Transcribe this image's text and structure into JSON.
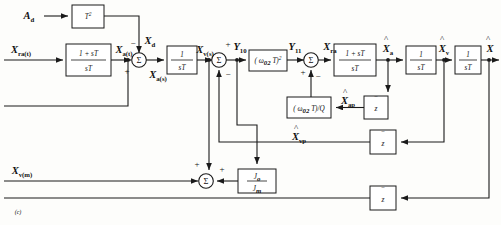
{
  "figure": {
    "caption": "(c)",
    "type": "control-system-block-diagram"
  },
  "inputs": [
    {
      "id": "a_d",
      "label": "A",
      "sub": "d"
    },
    {
      "id": "x_ra_t",
      "label": "X",
      "sub": "ra(t)"
    },
    {
      "id": "x_v_m",
      "label": "X",
      "sub": "v(m)"
    }
  ],
  "blocks": [
    {
      "id": "t-squared",
      "name": "t-squared-block",
      "numerator": "T",
      "sup": "2",
      "kind": "plain"
    },
    {
      "id": "lead-1",
      "name": "lead-compensator-block-1",
      "numerator": "1 + sT",
      "denominator": "sT",
      "kind": "fraction"
    },
    {
      "id": "integrator-1",
      "name": "integrator-block-1",
      "numerator": "1",
      "denominator": "sT",
      "kind": "fraction"
    },
    {
      "id": "omega-sq",
      "name": "omega-squared-gain-block",
      "text": "( ω",
      "sub": "02",
      "tail": " T)",
      "sup": "2",
      "kind": "gain-sq"
    },
    {
      "id": "omega-q",
      "name": "omega-over-q-gain-block",
      "text": "( ω",
      "sub": "02",
      "tail": " T)/Q",
      "kind": "gain-q"
    },
    {
      "id": "lead-2",
      "name": "lead-compensator-block-2",
      "numerator": "1 + sT",
      "denominator": "sT",
      "kind": "fraction"
    },
    {
      "id": "integrator-2",
      "name": "integrator-block-2",
      "numerator": "1",
      "denominator": "sT",
      "kind": "fraction"
    },
    {
      "id": "integrator-3",
      "name": "integrator-block-3",
      "numerator": "1",
      "denominator": "sT",
      "kind": "fraction"
    },
    {
      "id": "inertia-ratio",
      "name": "inertia-ratio-block",
      "numerator": "J",
      "nsub": "o",
      "denominator": "J",
      "dsub": "m",
      "kind": "inertia"
    },
    {
      "id": "delay-1",
      "name": "unit-delay-block-1",
      "text": "z",
      "kind": "delay"
    },
    {
      "id": "delay-2",
      "name": "unit-delay-block-2",
      "text": "z",
      "kind": "delay"
    },
    {
      "id": "delay-3",
      "name": "unit-delay-block-3",
      "text": "z",
      "kind": "delay"
    }
  ],
  "summers": [
    {
      "id": "sum-1",
      "name": "summing-junction-1",
      "glyph": "Σ",
      "signs": [
        "−",
        "+"
      ]
    },
    {
      "id": "sum-2",
      "name": "summing-junction-2",
      "glyph": "Σ",
      "signs": [
        "+",
        "−"
      ]
    },
    {
      "id": "sum-3",
      "name": "summing-junction-3",
      "glyph": "Σ",
      "signs": [
        "+",
        "−"
      ]
    },
    {
      "id": "sum-4",
      "name": "summing-junction-4",
      "glyph": "Σ",
      "signs": [
        "+",
        "+"
      ]
    }
  ],
  "signals": [
    {
      "id": "x_d",
      "base": "X",
      "sub": "d",
      "hat": false
    },
    {
      "id": "x_a_t",
      "base": "X",
      "sub": "a(t)",
      "hat": false
    },
    {
      "id": "x_a_s",
      "base": "X",
      "sub": "a(s)",
      "hat": false
    },
    {
      "id": "x_v_s",
      "base": "X",
      "sub": "v(s)",
      "hat": false
    },
    {
      "id": "y10",
      "base": "Y",
      "sub": "10",
      "hat": false
    },
    {
      "id": "y11",
      "base": "Y",
      "sub": "11",
      "hat": false
    },
    {
      "id": "x_ra",
      "base": "X",
      "sub": "ra",
      "hat": false
    },
    {
      "id": "x_a_hat",
      "base": "X",
      "sub": "a",
      "hat": true
    },
    {
      "id": "x_v_hat",
      "base": "X",
      "sub": "v",
      "hat": true
    },
    {
      "id": "x_hat",
      "base": "X",
      "sub": "",
      "hat": true
    },
    {
      "id": "x_ap_hat",
      "base": "X",
      "sub": "ap",
      "hat": true
    },
    {
      "id": "x_vp_hat",
      "base": "X",
      "sub": "vp",
      "hat": true
    }
  ],
  "colors": {
    "stroke": "#1a1a1a",
    "background": "#fdfdfb",
    "block_fill": "#ffffff"
  }
}
